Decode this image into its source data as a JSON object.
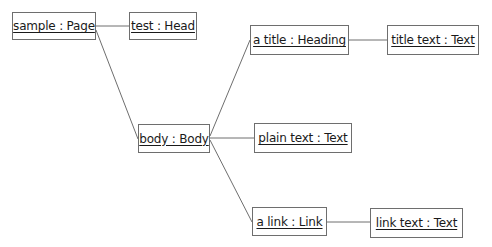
{
  "diagram": {
    "type": "uml-object-diagram",
    "nodes": [
      {
        "id": "page",
        "label": "sample : Page"
      },
      {
        "id": "head",
        "label": "test : Head"
      },
      {
        "id": "body",
        "label": "body : Body"
      },
      {
        "id": "heading",
        "label": "a title : Heading"
      },
      {
        "id": "titletext",
        "label": "title text : Text"
      },
      {
        "id": "plaintext",
        "label": "plain text : Text"
      },
      {
        "id": "link",
        "label": "a link : Link"
      },
      {
        "id": "linktext",
        "label": "link text : Text"
      }
    ],
    "edges": [
      {
        "from": "page",
        "to": "head"
      },
      {
        "from": "page",
        "to": "body"
      },
      {
        "from": "body",
        "to": "heading"
      },
      {
        "from": "heading",
        "to": "titletext"
      },
      {
        "from": "body",
        "to": "plaintext"
      },
      {
        "from": "body",
        "to": "link"
      },
      {
        "from": "link",
        "to": "linktext"
      }
    ],
    "colors": {
      "line": "#6e6e6e",
      "text": "#1a1a1a",
      "background": "#ffffff"
    }
  }
}
